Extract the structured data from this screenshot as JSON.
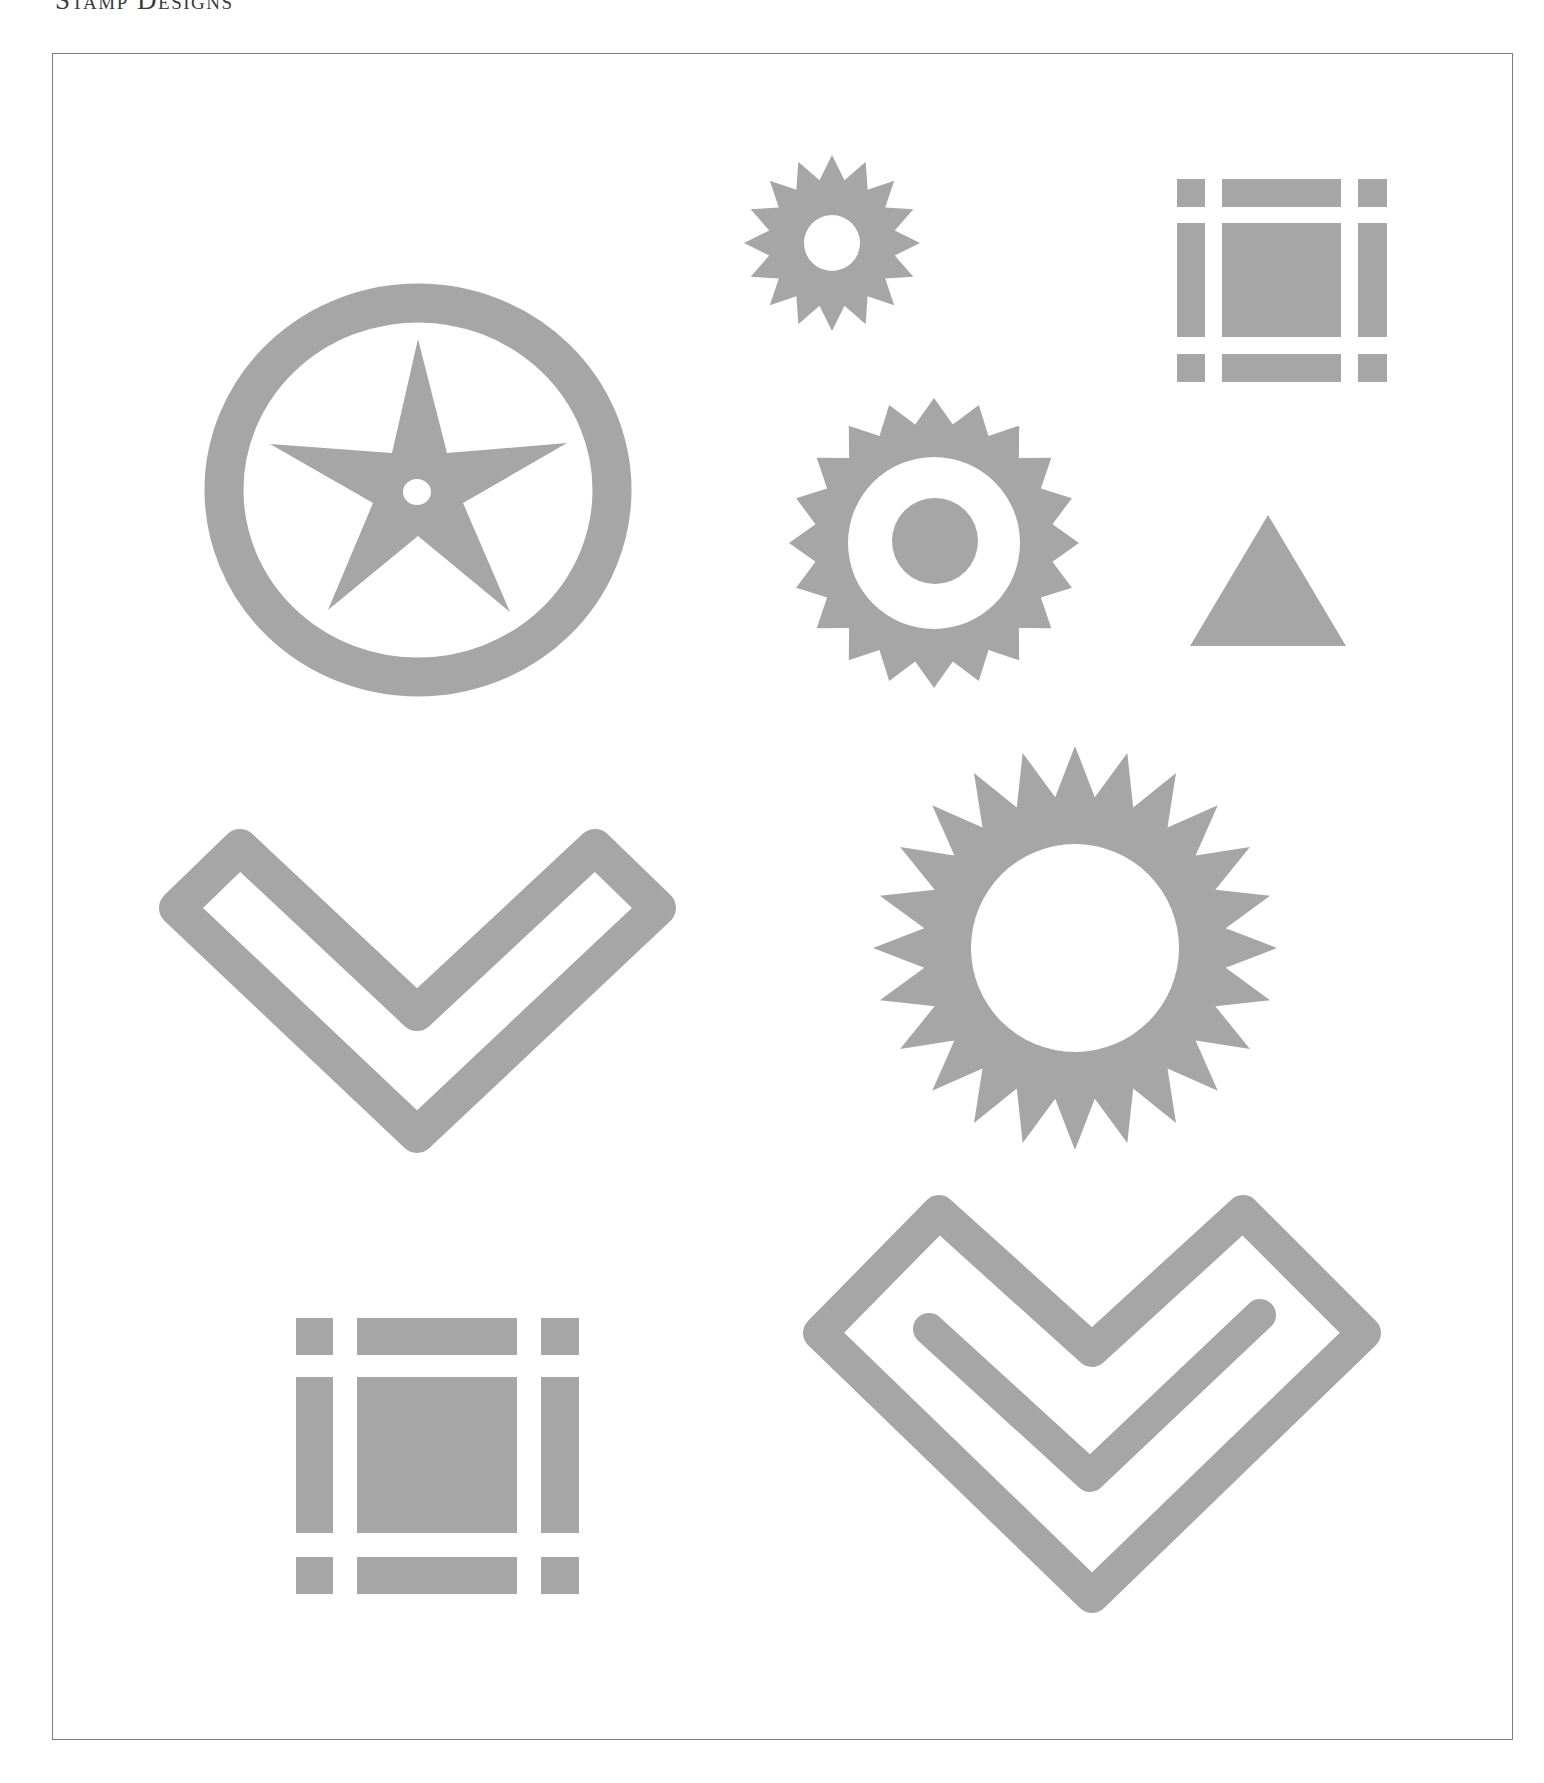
{
  "page": {
    "title": "Stamp Designs"
  },
  "style": {
    "fill_color": "#a6a6a6",
    "frame_color": "#7d7d7d",
    "background": "#ffffff"
  },
  "designs": [
    {
      "id": "circle-star",
      "label": "Star in circle stamp"
    },
    {
      "id": "small-sun",
      "label": "Small 16-point sun with hole",
      "points": 16
    },
    {
      "id": "grid-square-top",
      "label": "Square with corner grid bars"
    },
    {
      "id": "medium-sun",
      "label": "20-point sun with ring and dot",
      "points": 20
    },
    {
      "id": "triangle",
      "label": "Solid triangle"
    },
    {
      "id": "chevron-outline",
      "label": "Outlined chevron"
    },
    {
      "id": "large-sun",
      "label": "Large 24-point sun with hole",
      "points": 24
    },
    {
      "id": "grid-square-bottom",
      "label": "Square with corner grid bars (large)"
    },
    {
      "id": "chevron-double",
      "label": "Outlined chevron with inner hook"
    }
  ]
}
